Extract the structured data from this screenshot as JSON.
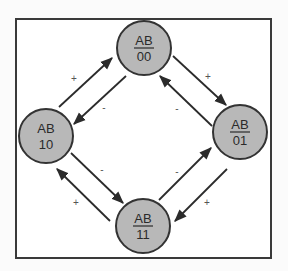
{
  "diagram": {
    "type": "state-transition",
    "frame": {
      "x": 16,
      "y": 19,
      "width": 255,
      "height": 239,
      "stroke": "#3a3a3a"
    },
    "style": {
      "node_fill": "#b8b8b8",
      "node_stroke": "#333333",
      "edge_color": "#2b2b2b",
      "label_color": "#2a2a2a"
    },
    "nodes": [
      {
        "id": "00",
        "header": "AB",
        "value": "00",
        "underlined": true,
        "cx": 144,
        "cy": 48,
        "r": 27
      },
      {
        "id": "10",
        "header": "AB",
        "value": "10",
        "underlined": false,
        "cx": 46,
        "cy": 136,
        "r": 27
      },
      {
        "id": "01",
        "header": "AB",
        "value": "01",
        "underlined": true,
        "cx": 240,
        "cy": 132,
        "r": 27
      },
      {
        "id": "11",
        "header": "AB",
        "value": "11",
        "underlined": true,
        "cx": 143,
        "cy": 226,
        "r": 27
      }
    ],
    "edges": [
      {
        "from": "10",
        "to": "00",
        "label": "+",
        "x1": 59,
        "y1": 107,
        "x2": 112,
        "y2": 58,
        "lx": 74,
        "ly": 82
      },
      {
        "from": "00",
        "to": "10",
        "label": "-",
        "x1": 126,
        "y1": 76,
        "x2": 74,
        "y2": 124,
        "lx": 104,
        "ly": 111
      },
      {
        "from": "00",
        "to": "01",
        "label": "+",
        "x1": 173,
        "y1": 56,
        "x2": 226,
        "y2": 105,
        "lx": 208,
        "ly": 80
      },
      {
        "from": "01",
        "to": "00",
        "label": "-",
        "x1": 212,
        "y1": 126,
        "x2": 160,
        "y2": 76,
        "lx": 177,
        "ly": 112
      },
      {
        "from": "10",
        "to": "11",
        "label": "-",
        "x1": 71,
        "y1": 153,
        "x2": 123,
        "y2": 203,
        "lx": 102,
        "ly": 173
      },
      {
        "from": "11",
        "to": "10",
        "label": "+",
        "x1": 110,
        "y1": 221,
        "x2": 57,
        "y2": 169,
        "lx": 76,
        "ly": 206
      },
      {
        "from": "11",
        "to": "01",
        "label": "-",
        "x1": 159,
        "y1": 200,
        "x2": 211,
        "y2": 148,
        "lx": 177,
        "ly": 175
      },
      {
        "from": "01",
        "to": "11",
        "label": "+",
        "x1": 227,
        "y1": 169,
        "x2": 175,
        "y2": 221,
        "lx": 207,
        "ly": 206
      }
    ]
  }
}
